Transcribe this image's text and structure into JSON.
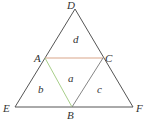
{
  "diagram": {
    "vertices": {
      "D": {
        "label": "D",
        "x": 75,
        "y": 9
      },
      "E": {
        "label": "E",
        "x": 15,
        "y": 107
      },
      "F": {
        "label": "F",
        "x": 133,
        "y": 107
      },
      "A": {
        "label": "A",
        "x": 45,
        "y": 58
      },
      "B": {
        "label": "B",
        "x": 72,
        "y": 107
      },
      "C": {
        "label": "C",
        "x": 103,
        "y": 58
      }
    },
    "regions": {
      "a": "a",
      "b": "b",
      "c": "c",
      "d": "d"
    },
    "colors": {
      "outline": "#555555",
      "segment_AC": "#d9a58a",
      "segment_AB": "#a8cf8a",
      "segment_BC": "#777777"
    }
  }
}
